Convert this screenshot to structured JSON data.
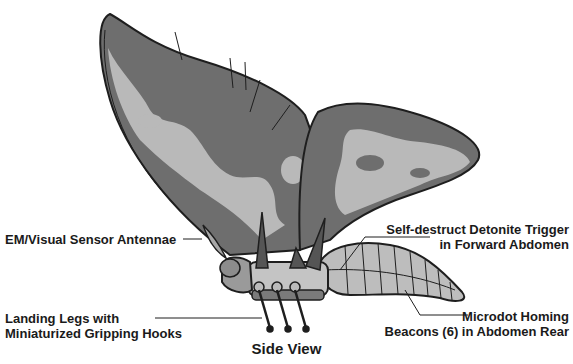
{
  "diagram": {
    "title": "Side View",
    "labels": [
      {
        "id": "antennae",
        "lines": [
          "EM/Visual Sensor Antennae"
        ]
      },
      {
        "id": "legs",
        "lines": [
          "Landing Legs with",
          "Miniaturized Gripping Hooks"
        ]
      },
      {
        "id": "trigger",
        "lines": [
          "Self-destruct Detonite Trigger",
          "in Forward Abdomen"
        ]
      },
      {
        "id": "beacons",
        "lines": [
          "Microdot Homing",
          "Beacons (6) in Abdomen Rear"
        ]
      }
    ],
    "colors": {
      "wing_dark": "#6e6e6e",
      "wing_light": "#b9b9b9",
      "outline": "#1e1e1e",
      "body": "#c4c4c4",
      "abdomen": "#bdbdbd",
      "text": "#1a1a1a"
    }
  }
}
